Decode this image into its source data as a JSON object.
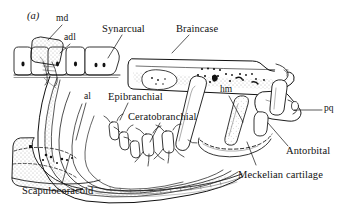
{
  "figure": {
    "panel_label": "(a)",
    "background_color": "#ffffff",
    "ink_color": "#111111",
    "stipple_color": "#555555",
    "description_type": "anatomical line drawing, lateral view of chondrichthyan cranial and pharyngeal skeleton"
  },
  "labels": [
    {
      "id": "md",
      "text": "md",
      "size": "sm",
      "x": 56,
      "y": 14,
      "leader": {
        "x1": 62,
        "y1": 25,
        "x2": 48,
        "y2": 40
      }
    },
    {
      "id": "adl",
      "text": "adl",
      "size": "sm",
      "x": 64,
      "y": 33,
      "leader": {
        "x1": 70,
        "y1": 44,
        "x2": 60,
        "y2": 53
      }
    },
    {
      "id": "synarcual",
      "text": "Synarcual",
      "size": "lg",
      "x": 102,
      "y": 24,
      "leader": {
        "x1": 122,
        "y1": 35,
        "x2": 108,
        "y2": 58
      }
    },
    {
      "id": "braincase",
      "text": "Braincase",
      "size": "lg",
      "x": 176,
      "y": 24,
      "leader": {
        "x1": 189,
        "y1": 35,
        "x2": 172,
        "y2": 53
      }
    },
    {
      "id": "hm",
      "text": "hm",
      "size": "sm",
      "x": 220,
      "y": 85,
      "leader": {
        "x1": 229,
        "y1": 96,
        "x2": 243,
        "y2": 122
      }
    },
    {
      "id": "pq",
      "text": "pq",
      "size": "sm",
      "x": 324,
      "y": 104,
      "leader": {
        "x1": 322,
        "y1": 110,
        "x2": 294,
        "y2": 110
      }
    },
    {
      "id": "al",
      "text": "al",
      "size": "sm",
      "x": 84,
      "y": 92,
      "leader": {
        "x1": 86,
        "y1": 103,
        "x2": 76,
        "y2": 140
      }
    },
    {
      "id": "epibranchial",
      "text": "Epibranchial",
      "size": "lg",
      "x": 108,
      "y": 92,
      "leader": {
        "x1": 128,
        "y1": 103,
        "x2": 120,
        "y2": 120
      }
    },
    {
      "id": "ceratobranchial",
      "text": "Ceratobranchial",
      "size": "lg",
      "x": 128,
      "y": 112,
      "leader": {
        "x1": 160,
        "y1": 123,
        "x2": 150,
        "y2": 142
      }
    },
    {
      "id": "antorbital",
      "text": "Antorbital",
      "size": "lg",
      "x": 286,
      "y": 146,
      "leader": {
        "x1": 288,
        "y1": 146,
        "x2": 268,
        "y2": 123
      }
    },
    {
      "id": "meckelian-cartilage",
      "text": "Meckelian cartilage",
      "size": "lg",
      "x": 238,
      "y": 170,
      "leader": {
        "x1": 256,
        "y1": 165,
        "x2": 247,
        "y2": 142
      }
    },
    {
      "id": "scapulocoracoid",
      "text": "Scapulocoracoid",
      "size": "lg",
      "x": 22,
      "y": 186,
      "leader": {
        "x1": 62,
        "y1": 184,
        "x2": 70,
        "y2": 155
      }
    }
  ]
}
